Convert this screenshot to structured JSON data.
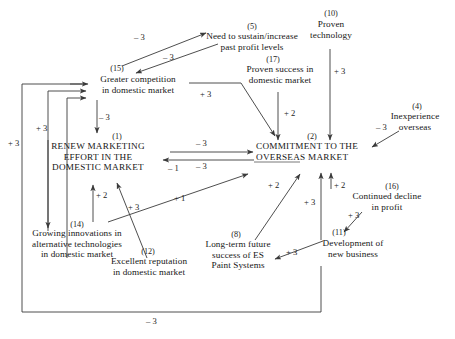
{
  "diagram": {
    "type": "causal-loop-diagram",
    "background": "#ffffff",
    "line_color": "#3a3a3a",
    "text_color": "#161616",
    "nodes": [
      {
        "id": "5",
        "ref": "(5)",
        "label": "Need to sustain/increase\npast  profit levels",
        "x": 252,
        "y": 44,
        "w": 130,
        "style": "normal"
      },
      {
        "id": "10",
        "ref": "(10)",
        "label": "Proven\ntechnology",
        "x": 330,
        "y": 30,
        "w": 70,
        "style": "normal"
      },
      {
        "id": "17",
        "ref": "(17)",
        "label": "Proven success in\ndomestic market",
        "x": 292,
        "y": 76,
        "w": 98,
        "style": "normal"
      },
      {
        "id": "15",
        "ref": "(15)",
        "label": "Greater competition\nin domestic market",
        "x": 132,
        "y": 85,
        "w": 110,
        "style": "normal"
      },
      {
        "id": "4",
        "ref": "(4)",
        "label": "Inexperience\noverseas",
        "x": 415,
        "y": 122,
        "w": 76,
        "style": "normal"
      },
      {
        "id": "2",
        "ref": "(2)",
        "label": "COMMITMENT TO THE\nOVERSEAS MARKET",
        "x": 322,
        "y": 152,
        "w": 132,
        "style": "caps"
      },
      {
        "id": "1",
        "ref": "(1)",
        "label": "RENEW MARKETING\nEFFORT IN THE\nDOMESTIC MARKET",
        "x": 97,
        "y": 153,
        "w": 110,
        "style": "caps"
      },
      {
        "id": "16",
        "ref": "(16)",
        "label": "Continued decline\nin profit",
        "x": 385,
        "y": 202,
        "w": 96,
        "style": "normal"
      },
      {
        "id": "14",
        "ref": "(14)",
        "label": "Growing innovations in\nalternative technologies\nin domestic market",
        "x": 77,
        "y": 240,
        "w": 124,
        "style": "normal"
      },
      {
        "id": "11",
        "ref": "(11)",
        "label": "Development of\nnew business",
        "x": 362,
        "y": 248,
        "w": 86,
        "style": "normal"
      },
      {
        "id": "8",
        "ref": "(8)",
        "label": "Long-term future\nsuccess of ES\nPaint Systems",
        "x": 236,
        "y": 250,
        "w": 84,
        "style": "normal"
      },
      {
        "id": "12",
        "ref": "(12)",
        "label": "Excellent reputation\nin domestic market",
        "x": 148,
        "y": 267,
        "w": 110,
        "style": "normal"
      }
    ],
    "edge_labels": [
      {
        "id": "e1",
        "weight": "– 3",
        "x": 141,
        "y": 38,
        "from": "15",
        "to": "5"
      },
      {
        "id": "e2",
        "weight": "– 3",
        "x": 170,
        "y": 58,
        "from": "5",
        "to": "15"
      },
      {
        "id": "e3",
        "weight": "+ 3",
        "x": 341,
        "y": 72,
        "from": "10",
        "to": "2"
      },
      {
        "id": "e4",
        "weight": "+ 3",
        "x": 206,
        "y": 95,
        "from": "15",
        "to": "2"
      },
      {
        "id": "e5",
        "weight": "+ 2",
        "x": 290,
        "y": 114,
        "from": "17",
        "to": "2"
      },
      {
        "id": "e6",
        "weight": "– 3",
        "x": 383,
        "y": 128,
        "from": "4",
        "to": "2"
      },
      {
        "id": "e7",
        "weight": "+ 3",
        "x": 42,
        "y": 129,
        "from": "14",
        "to": "15"
      },
      {
        "id": "e8",
        "weight": "– 3",
        "x": 103,
        "y": 118,
        "from": "15",
        "to": "1"
      },
      {
        "id": "e9",
        "weight": "– 3",
        "x": 203,
        "y": 143,
        "from": "1",
        "to": "2"
      },
      {
        "id": "e10",
        "weight": "+ 3",
        "x": 14,
        "y": 144,
        "from": "12",
        "to": "15"
      },
      {
        "id": "e11",
        "weight": "– 1",
        "x": 174,
        "y": 170,
        "from": "2",
        "to": "1"
      },
      {
        "id": "e12",
        "weight": "– 3",
        "x": 203,
        "y": 167,
        "from": "2",
        "to": "1"
      },
      {
        "id": "e13",
        "weight": "+ 2",
        "x": 274,
        "y": 186,
        "from": "8",
        "to": "2"
      },
      {
        "id": "e14",
        "weight": "+ 2",
        "x": 340,
        "y": 186,
        "from": "16",
        "to": "2"
      },
      {
        "id": "e15",
        "weight": "+ 3",
        "x": 313,
        "y": 203,
        "from": "11",
        "to": "2"
      },
      {
        "id": "e16",
        "weight": "+ 1",
        "x": 180,
        "y": 199,
        "from": "14",
        "to": "2"
      },
      {
        "id": "e17",
        "weight": "+ 3",
        "x": 351,
        "y": 216,
        "from": "16",
        "to": "11"
      },
      {
        "id": "e18",
        "weight": "+ 2",
        "x": 101,
        "y": 196,
        "from": "14",
        "to": "1"
      },
      {
        "id": "e19",
        "weight": "+ 3",
        "x": 134,
        "y": 208,
        "from": "12",
        "to": "1"
      },
      {
        "id": "e20",
        "weight": "+ 3",
        "x": 292,
        "y": 253,
        "from": "11",
        "to": "8"
      },
      {
        "id": "e21",
        "weight": "– 3",
        "x": 153,
        "y": 322,
        "from": "11",
        "to": "15"
      }
    ],
    "relations": [
      {
        "from": "(15) Greater competition in domestic market",
        "to": "(5) Need to sustain/increase past profit levels",
        "weight": "-3"
      },
      {
        "from": "(5) Need to sustain/increase past profit levels",
        "to": "(15) Greater competition in domestic market",
        "weight": "-3"
      },
      {
        "from": "(10) Proven technology",
        "to": "(2) COMMITMENT TO THE OVERSEAS MARKET",
        "weight": "+3"
      },
      {
        "from": "(15) Greater competition in domestic market",
        "to": "(2) COMMITMENT TO THE OVERSEAS MARKET",
        "weight": "+3"
      },
      {
        "from": "(17) Proven success in domestic market",
        "to": "(2) COMMITMENT TO THE OVERSEAS MARKET",
        "weight": "+2"
      },
      {
        "from": "(4) Inexperience overseas",
        "to": "(2) COMMITMENT TO THE OVERSEAS MARKET",
        "weight": "-3"
      },
      {
        "from": "(15) Greater competition in domestic market",
        "to": "(1) RENEW MARKETING EFFORT IN THE DOMESTIC MARKET",
        "weight": "-3"
      },
      {
        "from": "(1) RENEW MARKETING EFFORT IN THE DOMESTIC MARKET",
        "to": "(2) COMMITMENT TO THE OVERSEAS MARKET",
        "weight": "-3"
      },
      {
        "from": "(2) COMMITMENT TO THE OVERSEAS MARKET",
        "to": "(1) RENEW MARKETING EFFORT IN THE DOMESTIC MARKET",
        "weight": "-1"
      },
      {
        "from": "(2) COMMITMENT TO THE OVERSEAS MARKET",
        "to": "(1) RENEW MARKETING EFFORT IN THE DOMESTIC MARKET",
        "weight": "-3"
      },
      {
        "from": "(14) Growing innovations in alternative technologies in domestic market",
        "to": "(15) Greater competition in domestic market",
        "weight": "+3"
      },
      {
        "from": "(12) Excellent reputation in domestic market",
        "to": "(15) Greater competition in domestic market",
        "weight": "+3"
      },
      {
        "from": "(14) Growing innovations in alternative technologies in domestic market",
        "to": "(1) RENEW MARKETING EFFORT IN THE DOMESTIC MARKET",
        "weight": "+2"
      },
      {
        "from": "(12) Excellent reputation in domestic market",
        "to": "(1) RENEW MARKETING EFFORT IN THE DOMESTIC MARKET",
        "weight": "+3"
      },
      {
        "from": "(14) Growing innovations in alternative technologies in domestic market",
        "to": "(2) COMMITMENT TO THE OVERSEAS MARKET",
        "weight": "+1"
      },
      {
        "from": "(8) Long-term future success of ES Paint Systems",
        "to": "(2) COMMITMENT TO THE OVERSEAS MARKET",
        "weight": "+2"
      },
      {
        "from": "(16) Continued decline in profit",
        "to": "(2) COMMITMENT TO THE OVERSEAS MARKET",
        "weight": "+2"
      },
      {
        "from": "(11) Development of new business",
        "to": "(2) COMMITMENT TO THE OVERSEAS MARKET",
        "weight": "+3"
      },
      {
        "from": "(16) Continued decline in profit",
        "to": "(11) Development of new business",
        "weight": "+3"
      },
      {
        "from": "(11) Development of new business",
        "to": "(8) Long-term future success of ES Paint Systems",
        "weight": "+3"
      },
      {
        "from": "(11) Development of new business",
        "to": "(15) Greater competition in domestic market",
        "weight": "-3"
      }
    ]
  }
}
